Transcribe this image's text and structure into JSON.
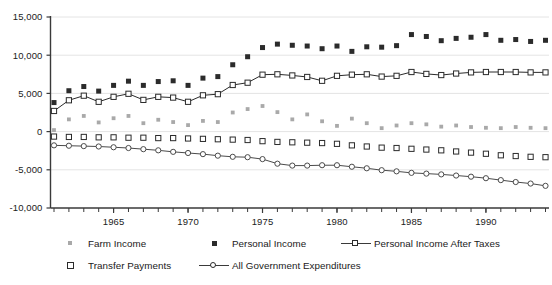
{
  "chart_data": {
    "type": "line",
    "title": "",
    "subtitle": "",
    "xlabel": "",
    "ylabel": "",
    "grid": true,
    "grid_axis": "y",
    "legend_position": "bottom",
    "xlim": [
      1961,
      1994
    ],
    "ylim": [
      -10000,
      15000
    ],
    "y_ticks": [
      15000,
      10000,
      5000,
      0,
      -5000,
      -10000
    ],
    "y_tick_labels": [
      "15,000",
      "10,000",
      "5,000",
      "0",
      "-5,000",
      "-10,000"
    ],
    "x_ticks": [
      1965,
      1970,
      1975,
      1980,
      1985,
      1990
    ],
    "x_tick_labels": [
      "1965",
      "1970",
      "1975",
      "1980",
      "1985",
      "1990"
    ],
    "x_minor_ticks_every": 1,
    "x": [
      1961,
      1962,
      1963,
      1964,
      1965,
      1966,
      1967,
      1968,
      1969,
      1970,
      1971,
      1972,
      1973,
      1974,
      1975,
      1976,
      1977,
      1978,
      1979,
      1980,
      1981,
      1982,
      1983,
      1984,
      1985,
      1986,
      1987,
      1988,
      1989,
      1990,
      1991,
      1992,
      1993,
      1994
    ],
    "series": [
      {
        "name": "Farm Income",
        "marker": "filled-square-small",
        "color": "#a9a9a9",
        "line": false,
        "values": [
          200,
          1600,
          2050,
          1200,
          1750,
          2050,
          1100,
          1550,
          1250,
          850,
          1400,
          1250,
          2500,
          2950,
          3350,
          2550,
          1600,
          2250,
          1350,
          750,
          1700,
          1100,
          450,
          800,
          1100,
          950,
          650,
          800,
          600,
          500,
          450,
          600,
          500,
          450
        ]
      },
      {
        "name": "Personal Income",
        "marker": "filled-square",
        "color": "#2b2b2b",
        "line": false,
        "values": [
          3800,
          5350,
          5900,
          5300,
          6050,
          6600,
          6050,
          6550,
          6650,
          6050,
          7000,
          7200,
          8750,
          9800,
          11000,
          11450,
          11300,
          11200,
          10850,
          11200,
          10500,
          11100,
          11050,
          11250,
          12700,
          12450,
          11900,
          12200,
          12350,
          12700,
          11950,
          12050,
          11800,
          11950
        ]
      },
      {
        "name": "Personal Income After Taxes",
        "marker": "open-square",
        "color": "#2b2b2b",
        "line": true,
        "values": [
          2700,
          4100,
          4700,
          3900,
          4550,
          4950,
          4150,
          4550,
          4450,
          3900,
          4750,
          4900,
          6100,
          6400,
          7450,
          7500,
          7350,
          7150,
          6650,
          7300,
          7450,
          7500,
          7200,
          7300,
          7800,
          7550,
          7400,
          7600,
          7750,
          7800,
          7800,
          7800,
          7750,
          7750
        ]
      },
      {
        "name": "Transfer Payments",
        "marker": "open-square",
        "color": "#2b2b2b",
        "line": false,
        "values": [
          -650,
          -700,
          -700,
          -750,
          -750,
          -800,
          -800,
          -850,
          -850,
          -900,
          -950,
          -1000,
          -1050,
          -1100,
          -1250,
          -1350,
          -1400,
          -1450,
          -1500,
          -1600,
          -1800,
          -1950,
          -2100,
          -2150,
          -2250,
          -2350,
          -2450,
          -2600,
          -2750,
          -2900,
          -3100,
          -3200,
          -3300,
          -3350
        ]
      },
      {
        "name": "All Government Expenditures",
        "marker": "open-circle",
        "color": "#4a4a4a",
        "line": true,
        "values": [
          -1800,
          -1850,
          -1900,
          -1950,
          -2050,
          -2150,
          -2300,
          -2450,
          -2650,
          -2800,
          -2950,
          -3150,
          -3300,
          -3350,
          -3600,
          -4200,
          -4450,
          -4450,
          -4400,
          -4400,
          -4600,
          -4800,
          -5050,
          -5200,
          -5400,
          -5500,
          -5600,
          -5750,
          -5900,
          -6100,
          -6350,
          -6600,
          -6800,
          -7100
        ]
      }
    ]
  },
  "legend": {
    "items": [
      {
        "label": "Farm Income",
        "marker": "filled-square-small-gray"
      },
      {
        "label": "Personal Income",
        "marker": "filled-square-black"
      },
      {
        "label": "Personal Income After Taxes",
        "marker": "line-open-square"
      },
      {
        "label": "Transfer Payments",
        "marker": "open-square"
      },
      {
        "label": "All Government Expenditures",
        "marker": "line-open-circle"
      }
    ]
  },
  "colors": {
    "gray_marker": "#a9a9a9",
    "black_marker": "#2b2b2b",
    "line_color": "#3a3a3a",
    "grid": "#e4e4e4",
    "axis": "#4a4a4a",
    "background": "#ffffff"
  }
}
